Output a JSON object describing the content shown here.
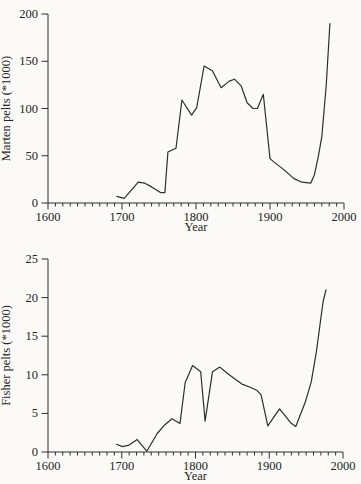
{
  "figure": {
    "ink_color": "#2e2e2e",
    "paper_color": "#fbfaf7"
  },
  "chart_data": [
    {
      "id": "marten",
      "type": "line",
      "title": "",
      "xlabel": "Year",
      "ylabel": "Marten pelts (*1000)",
      "xlim": [
        1600,
        2000
      ],
      "ylim": [
        0,
        200
      ],
      "x_major_ticks": [
        1600,
        1700,
        1800,
        1900,
        2000
      ],
      "x_tick_labels": [
        "1600",
        "1700",
        "1800",
        "1900",
        "2000"
      ],
      "x_minor_step": 10,
      "y_ticks": [
        0,
        50,
        100,
        150,
        200
      ],
      "y_tick_labels": [
        "0",
        "50",
        "100",
        "150",
        "200"
      ],
      "grid": false,
      "legend": "none",
      "series": [
        {
          "name": "Marten pelts harvested (thousands)",
          "points": [
            [
              1693,
              7
            ],
            [
              1703,
              5
            ],
            [
              1722,
              22
            ],
            [
              1731,
              21
            ],
            [
              1740,
              17
            ],
            [
              1752,
              11
            ],
            [
              1758,
              11
            ],
            [
              1762,
              54
            ],
            [
              1773,
              58
            ],
            [
              1781,
              109
            ],
            [
              1794,
              93
            ],
            [
              1801,
              101
            ],
            [
              1811,
              145
            ],
            [
              1822,
              140
            ],
            [
              1834,
              122
            ],
            [
              1845,
              129
            ],
            [
              1852,
              131
            ],
            [
              1861,
              124
            ],
            [
              1869,
              106
            ],
            [
              1877,
              100
            ],
            [
              1883,
              100
            ],
            [
              1891,
              115
            ],
            [
              1900,
              47
            ],
            [
              1906,
              43
            ],
            [
              1919,
              35
            ],
            [
              1932,
              26
            ],
            [
              1943,
              22
            ],
            [
              1955,
              21
            ],
            [
              1960,
              30
            ],
            [
              1965,
              48
            ],
            [
              1970,
              70
            ],
            [
              1976,
              124
            ],
            [
              1981,
              190
            ]
          ]
        }
      ]
    },
    {
      "id": "fisher",
      "type": "line",
      "title": "",
      "xlabel": "Year",
      "ylabel": "Fisher pelts (*1000)",
      "xlim": [
        1600,
        2000
      ],
      "ylim": [
        0,
        25
      ],
      "x_major_ticks": [
        1600,
        1700,
        1800,
        1900,
        2000
      ],
      "x_tick_labels": [
        "1600",
        "1700",
        "1800",
        "1900",
        "2000"
      ],
      "x_minor_step": 10,
      "y_ticks": [
        0,
        5,
        10,
        15,
        20,
        25
      ],
      "y_tick_labels": [
        "0",
        "5",
        "10",
        "15",
        "20",
        "25"
      ],
      "grid": false,
      "legend": "none",
      "series": [
        {
          "name": "Fisher pelts harvested (thousands)",
          "points": [
            [
              1693,
              1.0
            ],
            [
              1701,
              0.7
            ],
            [
              1710,
              0.9
            ],
            [
              1721,
              1.6
            ],
            [
              1734,
              0.1
            ],
            [
              1748,
              2.4
            ],
            [
              1757,
              3.4
            ],
            [
              1768,
              4.3
            ],
            [
              1779,
              3.7
            ],
            [
              1786,
              9.0
            ],
            [
              1796,
              11.2
            ],
            [
              1807,
              10.4
            ],
            [
              1813,
              4.0
            ],
            [
              1823,
              10.4
            ],
            [
              1833,
              11.0
            ],
            [
              1843,
              10.2
            ],
            [
              1853,
              9.5
            ],
            [
              1863,
              8.8
            ],
            [
              1874,
              8.4
            ],
            [
              1883,
              8.0
            ],
            [
              1889,
              7.4
            ],
            [
              1898,
              3.4
            ],
            [
              1914,
              5.6
            ],
            [
              1929,
              3.8
            ],
            [
              1936,
              3.3
            ],
            [
              1949,
              6.5
            ],
            [
              1957,
              9.1
            ],
            [
              1964,
              13.0
            ],
            [
              1973,
              19.5
            ],
            [
              1977,
              21.0
            ]
          ]
        }
      ]
    }
  ]
}
